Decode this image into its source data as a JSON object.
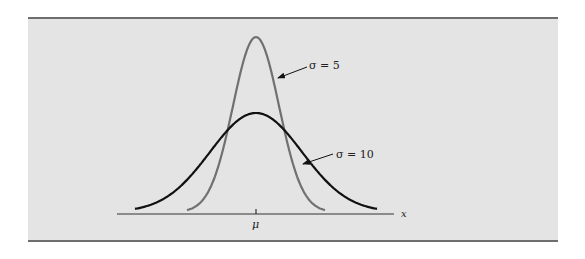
{
  "figure": {
    "background_color": "#e4e4e4",
    "border_color": "#6e6e6e"
  },
  "chart_data": {
    "type": "line",
    "title": "",
    "xlabel": "x",
    "ylabel": "",
    "x_tick_labels": [
      "μ"
    ],
    "grid": false,
    "legend": "annotations with arrows",
    "series": [
      {
        "name": "σ = 5",
        "sigma": 5,
        "color": "#707070",
        "description": "narrow, tall normal curve centered at μ"
      },
      {
        "name": "σ = 10",
        "sigma": 10,
        "color": "#111111",
        "description": "wide, flat normal curve centered at μ"
      }
    ],
    "annotations": [
      {
        "text": "σ = 5",
        "points_to": "σ = 5 curve right flank"
      },
      {
        "text": "σ = 10",
        "points_to": "σ = 10 curve right flank"
      }
    ]
  },
  "labels": {
    "sigma5": "σ = 5",
    "sigma10": "σ = 10",
    "mu": "μ",
    "x_axis": "x"
  }
}
